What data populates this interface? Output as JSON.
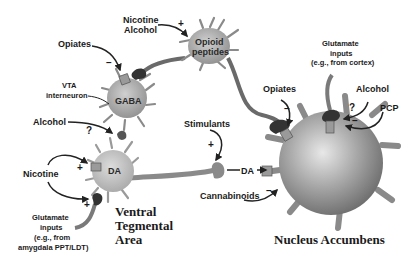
{
  "diagram": {
    "regions": {
      "vta": [
        "Ventral",
        "Tegmental",
        "Area"
      ],
      "nac": "Nucleus Accumbens"
    },
    "neurons": {
      "gaba": "GABA",
      "opioid": [
        "Opioid",
        "peptides"
      ],
      "da": "DA",
      "vta_interneuron": [
        "VTA",
        "interneuron"
      ]
    },
    "inputs": {
      "nicotine_alcohol_top": [
        "Nicotine",
        "Alcohol"
      ],
      "opiates_vta": "Opiates",
      "alcohol_vta": "Alcohol",
      "nicotine_vta": "Nicotine",
      "glutamate_vta": [
        "Glutamate",
        "inputs",
        "(e.g., from",
        "amygdala PPT/LDT)"
      ],
      "stimulants": "Stimulants",
      "da_release": "DA",
      "cannabinoids": "Cannabinoids",
      "opiates_nac": "Opiates",
      "glutamate_nac": [
        "Glutamate",
        "inputs",
        "(e.g., from cortex)"
      ],
      "alcohol_nac": "Alcohol",
      "pcp": "PCP"
    },
    "signs": {
      "nicotine_alcohol_opioid": "+",
      "opiates_gaba": "–",
      "alcohol_da": "?",
      "nicotine_da": "+",
      "nicotine_glut": "+",
      "stimulants_da": "+",
      "cannabinoids_nac": "–",
      "opiates_nac": "–",
      "alcohol_nac": "?",
      "pcp_nac": "–"
    },
    "colors": {
      "cell_fill": "#b0b0b0",
      "cell_dark": "#7a7a7a",
      "terminal": "#3a3a3a",
      "receptor": "#9a9a9a",
      "arrow": "#222222"
    }
  }
}
